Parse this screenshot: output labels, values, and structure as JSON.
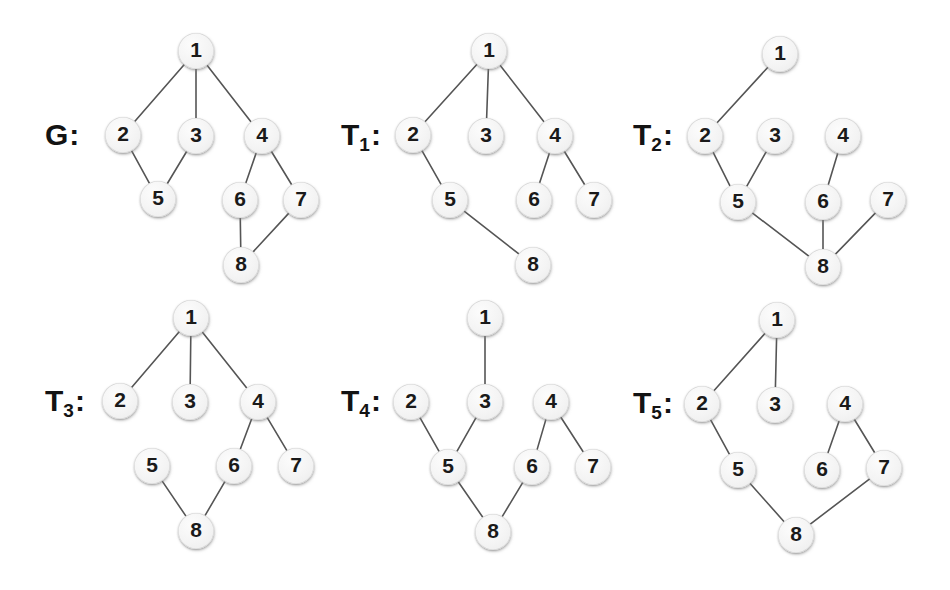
{
  "figure": {
    "title_visible": false,
    "background_color": "#ffffff",
    "node_fill_color": "#f4f4f4",
    "node_text_color": "#1a1a1a",
    "edge_color": "#555555",
    "edge_width": 1.6,
    "node_radius": 18
  },
  "chart_data": {
    "type": "diagram",
    "panels": [
      {
        "id": "G",
        "label_main": "G",
        "label_sub": "",
        "label_pos": {
          "x": 45,
          "y": 135
        },
        "nodes": [
          {
            "id": "1",
            "x": 196,
            "y": 51
          },
          {
            "id": "2",
            "x": 123,
            "y": 135
          },
          {
            "id": "3",
            "x": 196,
            "y": 136
          },
          {
            "id": "4",
            "x": 262,
            "y": 136
          },
          {
            "id": "5",
            "x": 158,
            "y": 199
          },
          {
            "id": "6",
            "x": 240,
            "y": 200
          },
          {
            "id": "7",
            "x": 301,
            "y": 200
          },
          {
            "id": "8",
            "x": 241,
            "y": 265
          }
        ],
        "edges": [
          [
            "1",
            "2"
          ],
          [
            "1",
            "3"
          ],
          [
            "1",
            "4"
          ],
          [
            "2",
            "5"
          ],
          [
            "3",
            "5"
          ],
          [
            "4",
            "6"
          ],
          [
            "4",
            "7"
          ],
          [
            "6",
            "8"
          ],
          [
            "7",
            "8"
          ]
        ]
      },
      {
        "id": "T1",
        "label_main": "T",
        "label_sub": "1",
        "label_pos": {
          "x": 341,
          "y": 135
        },
        "nodes": [
          {
            "id": "1",
            "x": 489,
            "y": 51
          },
          {
            "id": "2",
            "x": 413,
            "y": 135
          },
          {
            "id": "3",
            "x": 486,
            "y": 136
          },
          {
            "id": "4",
            "x": 555,
            "y": 136
          },
          {
            "id": "5",
            "x": 450,
            "y": 200
          },
          {
            "id": "6",
            "x": 534,
            "y": 200
          },
          {
            "id": "7",
            "x": 594,
            "y": 200
          },
          {
            "id": "8",
            "x": 533,
            "y": 265
          }
        ],
        "edges": [
          [
            "1",
            "2"
          ],
          [
            "1",
            "3"
          ],
          [
            "1",
            "4"
          ],
          [
            "2",
            "5"
          ],
          [
            "4",
            "6"
          ],
          [
            "4",
            "7"
          ],
          [
            "5",
            "8"
          ]
        ]
      },
      {
        "id": "T2",
        "label_main": "T",
        "label_sub": "2",
        "label_pos": {
          "x": 633,
          "y": 135
        },
        "nodes": [
          {
            "id": "1",
            "x": 780,
            "y": 54
          },
          {
            "id": "2",
            "x": 705,
            "y": 136
          },
          {
            "id": "3",
            "x": 775,
            "y": 136
          },
          {
            "id": "4",
            "x": 843,
            "y": 136
          },
          {
            "id": "5",
            "x": 738,
            "y": 202
          },
          {
            "id": "6",
            "x": 823,
            "y": 202
          },
          {
            "id": "7",
            "x": 888,
            "y": 200
          },
          {
            "id": "8",
            "x": 823,
            "y": 267
          }
        ],
        "edges": [
          [
            "1",
            "2"
          ],
          [
            "2",
            "5"
          ],
          [
            "3",
            "5"
          ],
          [
            "4",
            "6"
          ],
          [
            "5",
            "8"
          ],
          [
            "6",
            "8"
          ],
          [
            "7",
            "8"
          ]
        ]
      },
      {
        "id": "T3",
        "label_main": "T",
        "label_sub": "3",
        "label_pos": {
          "x": 45,
          "y": 401
        },
        "nodes": [
          {
            "id": "1",
            "x": 191,
            "y": 318
          },
          {
            "id": "2",
            "x": 120,
            "y": 401
          },
          {
            "id": "3",
            "x": 190,
            "y": 402
          },
          {
            "id": "4",
            "x": 258,
            "y": 402
          },
          {
            "id": "5",
            "x": 152,
            "y": 466
          },
          {
            "id": "6",
            "x": 234,
            "y": 466
          },
          {
            "id": "7",
            "x": 296,
            "y": 466
          },
          {
            "id": "8",
            "x": 196,
            "y": 531
          }
        ],
        "edges": [
          [
            "1",
            "2"
          ],
          [
            "1",
            "3"
          ],
          [
            "1",
            "4"
          ],
          [
            "4",
            "6"
          ],
          [
            "4",
            "7"
          ],
          [
            "5",
            "8"
          ],
          [
            "6",
            "8"
          ]
        ]
      },
      {
        "id": "T4",
        "label_main": "T",
        "label_sub": "4",
        "label_pos": {
          "x": 341,
          "y": 401
        },
        "nodes": [
          {
            "id": "1",
            "x": 485,
            "y": 318
          },
          {
            "id": "2",
            "x": 411,
            "y": 402
          },
          {
            "id": "3",
            "x": 485,
            "y": 402
          },
          {
            "id": "4",
            "x": 551,
            "y": 402
          },
          {
            "id": "5",
            "x": 448,
            "y": 467
          },
          {
            "id": "6",
            "x": 532,
            "y": 467
          },
          {
            "id": "7",
            "x": 593,
            "y": 467
          },
          {
            "id": "8",
            "x": 493,
            "y": 532
          }
        ],
        "edges": [
          [
            "1",
            "3"
          ],
          [
            "2",
            "5"
          ],
          [
            "3",
            "5"
          ],
          [
            "4",
            "6"
          ],
          [
            "4",
            "7"
          ],
          [
            "5",
            "8"
          ],
          [
            "6",
            "8"
          ]
        ]
      },
      {
        "id": "T5",
        "label_main": "T",
        "label_sub": "5",
        "label_pos": {
          "x": 633,
          "y": 403
        },
        "nodes": [
          {
            "id": "1",
            "x": 777,
            "y": 320
          },
          {
            "id": "2",
            "x": 702,
            "y": 404
          },
          {
            "id": "3",
            "x": 775,
            "y": 405
          },
          {
            "id": "4",
            "x": 845,
            "y": 404
          },
          {
            "id": "5",
            "x": 738,
            "y": 470
          },
          {
            "id": "6",
            "x": 822,
            "y": 470
          },
          {
            "id": "7",
            "x": 884,
            "y": 468
          },
          {
            "id": "8",
            "x": 796,
            "y": 535
          }
        ],
        "edges": [
          [
            "1",
            "2"
          ],
          [
            "1",
            "3"
          ],
          [
            "2",
            "5"
          ],
          [
            "4",
            "6"
          ],
          [
            "4",
            "7"
          ],
          [
            "5",
            "8"
          ],
          [
            "7",
            "8"
          ]
        ]
      }
    ]
  }
}
